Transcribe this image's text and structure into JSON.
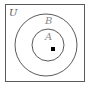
{
  "diagram": {
    "type": "venn",
    "universe": {
      "label": "U"
    },
    "sets": [
      {
        "label": "B",
        "contains": [
          "A"
        ]
      },
      {
        "label": "A",
        "subset_of": "B"
      }
    ],
    "point": {
      "inside": "A",
      "marker": "filled-square"
    },
    "colors": {
      "stroke": "#5a5a5a",
      "label": "#555555",
      "label_light": "#8a8a8a",
      "point": "#000000"
    }
  }
}
